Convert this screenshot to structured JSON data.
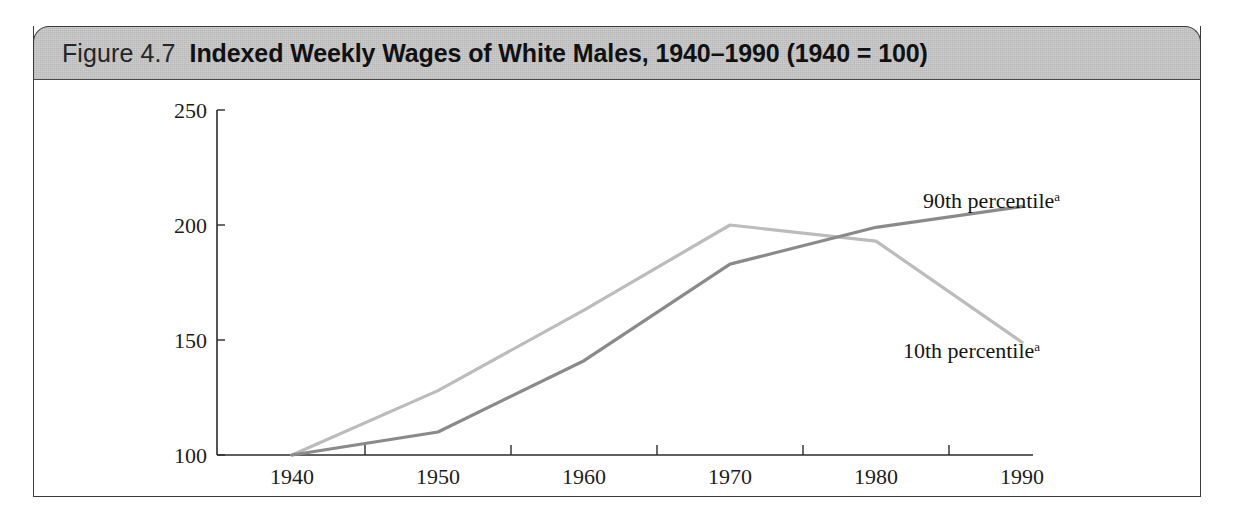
{
  "figure": {
    "number_label": "Figure 4.7",
    "title": "Indexed Weekly Wages of White Males, 1940–1990 (1940 = 100)",
    "header_background": "#c9c9c9",
    "frame_border_color": "#3a3a3a"
  },
  "chart_data": {
    "type": "line",
    "title": "Indexed Weekly Wages of White Males, 1940–1990 (1940 = 100)",
    "xlabel": "",
    "ylabel": "",
    "x": [
      1940,
      1950,
      1960,
      1970,
      1980,
      1990
    ],
    "xlim": [
      1935,
      1995
    ],
    "ylim": [
      100,
      250
    ],
    "yticks": [
      100,
      150,
      200,
      250
    ],
    "xticks": [
      1940,
      1950,
      1960,
      1970,
      1980,
      1990
    ],
    "grid": false,
    "legend": "inline-annotations",
    "series": [
      {
        "name": "90th percentile",
        "superscript": "a",
        "color": "#8a8a8a",
        "values": [
          100,
          110,
          141,
          183,
          199,
          208
        ]
      },
      {
        "name": "10th percentile",
        "superscript": "a",
        "color": "#bcbcbc",
        "values": [
          100,
          128,
          163,
          200,
          193,
          149
        ]
      }
    ],
    "annotations": [
      {
        "text": "90th percentile",
        "superscript": "a",
        "x": 1987,
        "y": 222
      },
      {
        "text": "10th percentile",
        "superscript": "a",
        "x": 1985,
        "y": 138
      }
    ]
  },
  "axis": {
    "y_tick_labels": [
      "250",
      "200",
      "150",
      "100"
    ],
    "x_tick_labels": [
      "1940",
      "1950",
      "1960",
      "1970",
      "1980",
      "1990"
    ]
  }
}
